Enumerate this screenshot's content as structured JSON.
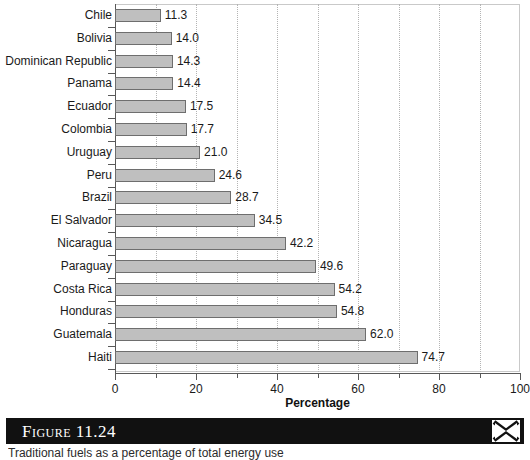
{
  "chart_data": {
    "type": "bar",
    "orientation": "horizontal",
    "title": "",
    "xlabel": "Percentage",
    "ylabel": "",
    "xlim": [
      0,
      100
    ],
    "xticks": [
      0,
      20,
      40,
      60,
      80,
      100
    ],
    "gridlines": [
      10,
      20,
      30,
      40,
      50,
      60,
      70,
      80,
      90
    ],
    "grid": true,
    "legend": false,
    "categories": [
      "Chile",
      "Bolivia",
      "Dominican Republic",
      "Panama",
      "Ecuador",
      "Colombia",
      "Uruguay",
      "Peru",
      "Brazil",
      "El Salvador",
      "Nicaragua",
      "Paraguay",
      "Costa Rica",
      "Honduras",
      "Guatemala",
      "Haiti"
    ],
    "values": [
      11.3,
      14.0,
      14.3,
      14.4,
      17.5,
      17.7,
      21.0,
      24.6,
      28.7,
      34.5,
      42.2,
      49.6,
      54.2,
      54.8,
      62.0,
      74.7
    ],
    "value_labels": [
      "11.3",
      "14.0",
      "14.3",
      "14.4",
      "17.5",
      "17.7",
      "21.0",
      "24.6",
      "28.7",
      "34.5",
      "42.2",
      "49.6",
      "54.2",
      "54.8",
      "62.0",
      "74.7"
    ],
    "bar_fill_color": "#bfbfbf",
    "bar_border_color": "#6e6e6e"
  },
  "caption": {
    "figure_label": "Figure 11.24",
    "text": "Traditional fuels as a percentage of total energy use",
    "logo_icon": "x-brand-icon"
  }
}
